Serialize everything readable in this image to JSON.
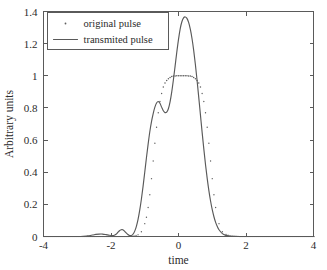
{
  "chart_data": {
    "type": "line",
    "title": "",
    "xlabel": "time",
    "ylabel": "Arbitrary units",
    "xlim": [
      -4,
      4
    ],
    "ylim": [
      0,
      1.4
    ],
    "xticks": [
      -4,
      -2,
      0,
      2,
      4
    ],
    "xtick_labels": [
      "-4",
      "-2",
      "0",
      "2",
      "4"
    ],
    "yticks": [
      0,
      0.2,
      0.4,
      0.6,
      0.8,
      1,
      1.2,
      1.4
    ],
    "ytick_labels": [
      "0",
      "0.2",
      "0.4",
      "0.6",
      "0.8",
      "1",
      "1.2",
      "1.4"
    ],
    "grid": false,
    "legend_position": "upper left",
    "series": [
      {
        "name": "original pulse",
        "marker": "dot",
        "style": "dotted",
        "color": "#5e5e5e",
        "x": [
          -4.0,
          -3.8,
          -3.6,
          -3.4,
          -3.2,
          -3.0,
          -2.8,
          -2.6,
          -2.4,
          -2.2,
          -2.0,
          -1.8,
          -1.6,
          -1.5,
          -1.4,
          -1.3,
          -1.2,
          -1.1,
          -1.0,
          -0.95,
          -0.9,
          -0.85,
          -0.8,
          -0.75,
          -0.7,
          -0.65,
          -0.6,
          -0.55,
          -0.5,
          -0.45,
          -0.4,
          -0.35,
          -0.3,
          -0.25,
          -0.2,
          -0.15,
          -0.1,
          -0.05,
          0.0,
          0.05,
          0.1,
          0.15,
          0.2,
          0.25,
          0.3,
          0.35,
          0.4,
          0.45,
          0.5,
          0.55,
          0.6,
          0.65,
          0.7,
          0.75,
          0.8,
          0.85,
          0.9,
          0.95,
          1.0,
          1.05,
          1.1,
          1.2,
          1.3,
          1.4,
          1.5,
          1.6,
          1.8,
          2.0,
          2.2,
          2.4,
          2.6,
          2.8,
          3.0,
          3.2,
          3.4,
          3.6,
          3.8,
          4.0
        ],
        "y": [
          0.0,
          0.0,
          0.0,
          0.0,
          0.0,
          0.0,
          0.0,
          0.0,
          0.0,
          0.0,
          0.0,
          0.0,
          0.0,
          0.0,
          0.002,
          0.005,
          0.012,
          0.03,
          0.08,
          0.12,
          0.18,
          0.26,
          0.36,
          0.47,
          0.58,
          0.68,
          0.77,
          0.84,
          0.89,
          0.93,
          0.955,
          0.97,
          0.982,
          0.99,
          0.995,
          0.998,
          0.999,
          1.0,
          1.0,
          1.0,
          1.0,
          1.0,
          1.0,
          1.0,
          0.999,
          0.998,
          0.995,
          0.99,
          0.982,
          0.97,
          0.955,
          0.93,
          0.89,
          0.84,
          0.77,
          0.68,
          0.58,
          0.47,
          0.36,
          0.26,
          0.18,
          0.08,
          0.03,
          0.012,
          0.005,
          0.002,
          0.0,
          0.0,
          0.0,
          0.0,
          0.0,
          0.0,
          0.0,
          0.0,
          0.0,
          0.0,
          0.0,
          0.0
        ]
      },
      {
        "name": "transmited pulse",
        "marker": "none",
        "style": "solid",
        "color": "#595959",
        "x": [
          -4.0,
          -3.6,
          -3.2,
          -2.9,
          -2.7,
          -2.55,
          -2.45,
          -2.35,
          -2.25,
          -2.15,
          -2.05,
          -1.95,
          -1.9,
          -1.85,
          -1.8,
          -1.75,
          -1.7,
          -1.65,
          -1.6,
          -1.55,
          -1.5,
          -1.45,
          -1.4,
          -1.35,
          -1.3,
          -1.25,
          -1.2,
          -1.15,
          -1.1,
          -1.05,
          -1.0,
          -0.95,
          -0.9,
          -0.85,
          -0.8,
          -0.75,
          -0.7,
          -0.65,
          -0.6,
          -0.55,
          -0.5,
          -0.45,
          -0.4,
          -0.35,
          -0.3,
          -0.25,
          -0.2,
          -0.15,
          -0.1,
          -0.05,
          0.0,
          0.05,
          0.1,
          0.15,
          0.2,
          0.25,
          0.3,
          0.35,
          0.4,
          0.45,
          0.5,
          0.55,
          0.6,
          0.65,
          0.7,
          0.75,
          0.8,
          0.85,
          0.9,
          0.95,
          1.0,
          1.05,
          1.1,
          1.15,
          1.2,
          1.3,
          1.4,
          1.5,
          1.6,
          1.8,
          2.0,
          2.4,
          2.8,
          3.2,
          3.6,
          4.0
        ],
        "y": [
          0.0,
          0.0,
          0.0,
          0.0,
          0.004,
          0.009,
          0.013,
          0.015,
          0.015,
          0.012,
          0.008,
          0.006,
          0.008,
          0.014,
          0.025,
          0.036,
          0.042,
          0.042,
          0.034,
          0.022,
          0.012,
          0.006,
          0.006,
          0.014,
          0.032,
          0.062,
          0.105,
          0.162,
          0.232,
          0.312,
          0.4,
          0.49,
          0.575,
          0.652,
          0.715,
          0.765,
          0.805,
          0.831,
          0.84,
          0.829,
          0.805,
          0.782,
          0.771,
          0.774,
          0.795,
          0.838,
          0.9,
          0.977,
          1.062,
          1.148,
          1.227,
          1.292,
          1.336,
          1.36,
          1.366,
          1.357,
          1.332,
          1.29,
          1.232,
          1.158,
          1.07,
          0.972,
          0.866,
          0.757,
          0.648,
          0.545,
          0.448,
          0.362,
          0.286,
          0.221,
          0.167,
          0.123,
          0.088,
          0.062,
          0.042,
          0.018,
          0.007,
          0.003,
          0.001,
          0.0,
          0.0,
          0.0,
          0.0,
          0.0,
          0.0,
          0.0
        ]
      }
    ]
  },
  "legend": {
    "items": [
      {
        "label": "original pulse",
        "marker": "dot"
      },
      {
        "label": "transmited pulse",
        "marker": "line"
      }
    ]
  }
}
